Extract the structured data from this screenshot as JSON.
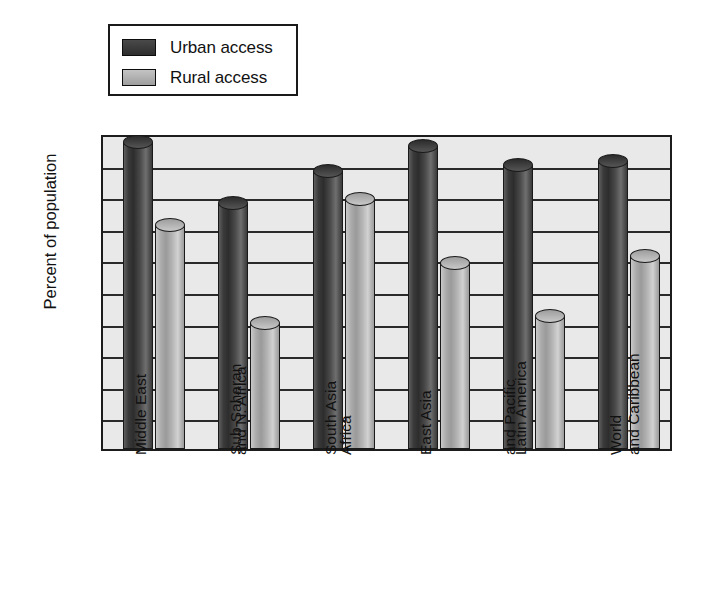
{
  "legend": {
    "position": "top-left",
    "entries": [
      {
        "label": "Urban access",
        "color": "#3a3a3a",
        "swatch_name": "urban-swatch"
      },
      {
        "label": "Rural access",
        "color": "#aeaeae",
        "swatch_name": "rural-swatch"
      }
    ]
  },
  "axes": {
    "ylabel": "Percent of population",
    "yticks": [
      "100",
      "90",
      "80",
      "70",
      "60",
      "50",
      "40",
      "30",
      "20",
      "10",
      "0"
    ]
  },
  "chart_data": {
    "type": "bar",
    "title": "",
    "xlabel": "",
    "ylabel": "Percent of population",
    "ylim": [
      0,
      100
    ],
    "ytick_step": 10,
    "grid": true,
    "legend_position": "top-left",
    "categories": [
      "Middle East and N. Africa",
      "Sub-Saharan Africa",
      "South Asia",
      "East Asia and Pacific",
      "Latin America and Caribbean",
      "World"
    ],
    "category_lines": [
      [
        "Middle East",
        "and N. Africa"
      ],
      [
        "Sub-Saharan",
        "Africa"
      ],
      [
        "South Asia"
      ],
      [
        "East Asia",
        "and Pacific"
      ],
      [
        "Latin America",
        "and Caribbean"
      ],
      [
        "World"
      ]
    ],
    "series": [
      {
        "name": "Urban access",
        "color": "#3a3a3a",
        "values": [
          97,
          78,
          88,
          96,
          90,
          91
        ]
      },
      {
        "name": "Rural access",
        "color": "#aeaeae",
        "values": [
          71,
          40,
          79,
          59,
          42,
          61
        ]
      }
    ]
  }
}
